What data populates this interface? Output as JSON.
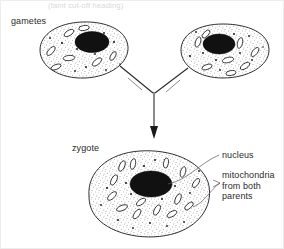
{
  "figure": {
    "top_caption": "(faint cut-off heading)",
    "background_color": "#ffffff",
    "ink_color": "#1a1a1a",
    "nucleus_color": "#111111"
  },
  "labels": {
    "gametes": "gametes",
    "zygote": "zygote",
    "nucleus": "nucleus",
    "mitochondria_line1": "mitochondria",
    "mitochondria_line2": "from both",
    "mitochondria_line3": "parents"
  },
  "cells": {
    "gamete_left": {
      "name": "gamete",
      "nucleus_count": 1,
      "mitochondria_count": 7
    },
    "gamete_right": {
      "name": "gamete",
      "nucleus_count": 1,
      "mitochondria_count": 8
    },
    "zygote": {
      "name": "zygote",
      "nucleus_count": 1,
      "mitochondria_count": 14
    }
  },
  "arrow": {
    "direction": "down",
    "description": "two gametes converge into one zygote"
  }
}
